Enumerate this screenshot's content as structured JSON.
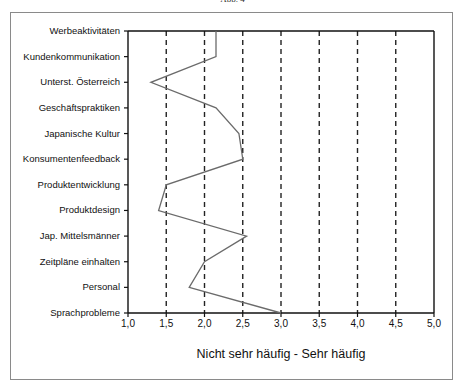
{
  "caption": "Abb. 4",
  "chart_data": {
    "type": "line",
    "orientation": "horizontal-profile",
    "title": "",
    "xlabel": "Nicht sehr häufig - Sehr häufig",
    "ylabel": "",
    "xlim": [
      1.0,
      5.0
    ],
    "x_ticks": [
      "1,0",
      "1,5",
      "2,0",
      "2,5",
      "3,0",
      "3,5",
      "4,0",
      "4,5",
      "5,0"
    ],
    "x_tick_values": [
      1.0,
      1.5,
      2.0,
      2.5,
      3.0,
      3.5,
      4.0,
      4.5,
      5.0
    ],
    "grid": "vertical dashed at 1.5–4.5",
    "categories": [
      "Werbeaktivitäten",
      "Kundenkommunikation",
      "Unterst. Österreich",
      "Geschäftspraktiken",
      "Japanische Kultur",
      "Konsumentenfeedback",
      "Produktentwicklung",
      "Produktdesign",
      "Jap. Mittelsmänner",
      "Zeitpläne einhalten",
      "Personal",
      "Sprachprobleme"
    ],
    "values": [
      2.15,
      2.15,
      1.3,
      2.15,
      2.45,
      2.5,
      1.5,
      1.4,
      2.55,
      2.0,
      1.8,
      3.0
    ],
    "line_color": "#6b6b6b",
    "axis_color": "#111111",
    "grid_color": "#222222"
  }
}
